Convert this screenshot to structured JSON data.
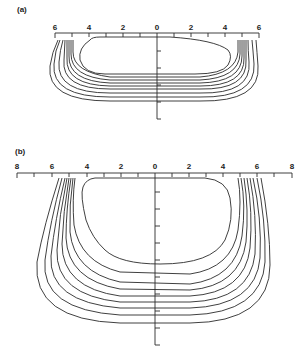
{
  "panels": [
    {
      "id": "a",
      "label": "(a)",
      "x_tick_labels": [
        "6",
        "4",
        "2",
        "0",
        "2",
        "4",
        "6"
      ],
      "x_range": [
        -6,
        6
      ],
      "contour_count": 9
    },
    {
      "id": "b",
      "label": "(b)",
      "x_tick_labels": [
        "8",
        "6",
        "4",
        "2",
        "0",
        "2",
        "4",
        "6",
        "8"
      ],
      "x_range": [
        -8,
        8
      ],
      "contour_count": 9
    }
  ],
  "colors": {
    "line": "#2a2a2a",
    "background": "#ffffff"
  }
}
